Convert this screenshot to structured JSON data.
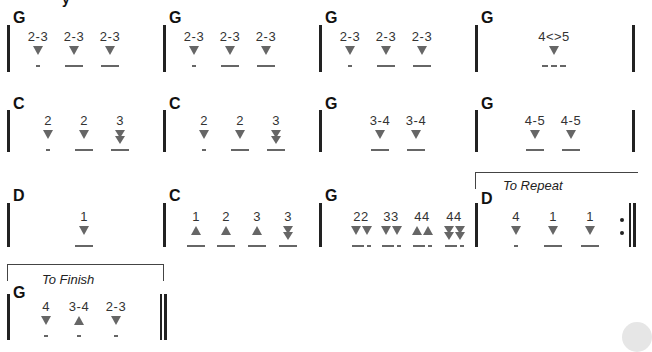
{
  "rows": [
    {
      "measures": [
        {
          "chord": "G",
          "notes": [
            {
              "num": "2-3",
              "g": "dn",
              "d": "short"
            },
            {
              "num": "2-3",
              "g": "dn",
              "d": "long"
            },
            {
              "num": "2-3",
              "g": "dn",
              "d": "long"
            }
          ]
        },
        {
          "chord": "G",
          "notes": [
            {
              "num": "2-3",
              "g": "dn",
              "d": "short"
            },
            {
              "num": "2-3",
              "g": "dn",
              "d": "long"
            },
            {
              "num": "2-3",
              "g": "dn",
              "d": "long"
            }
          ]
        },
        {
          "chord": "G",
          "notes": [
            {
              "num": "2-3",
              "g": "dn",
              "d": "short"
            },
            {
              "num": "2-3",
              "g": "dn",
              "d": "long"
            },
            {
              "num": "2-3",
              "g": "dn",
              "d": "long"
            }
          ]
        },
        {
          "chord": "G",
          "notes": [
            {
              "num": "4<>5",
              "g": "dn",
              "d": "dash"
            }
          ]
        }
      ]
    },
    {
      "measures": [
        {
          "chord": "C",
          "notes": [
            {
              "num": "2",
              "g": "dn",
              "d": "short"
            },
            {
              "num": "2",
              "g": "dn",
              "d": "long"
            },
            {
              "num": "3",
              "g": "ddn",
              "d": "long"
            }
          ]
        },
        {
          "chord": "C",
          "notes": [
            {
              "num": "2",
              "g": "dn",
              "d": "short"
            },
            {
              "num": "2",
              "g": "dn",
              "d": "long"
            },
            {
              "num": "3",
              "g": "ddn",
              "d": "long"
            }
          ]
        },
        {
          "chord": "G",
          "notes": [
            {
              "num": "3-4",
              "g": "dn",
              "d": "long"
            },
            {
              "num": "3-4",
              "g": "dn",
              "d": "long"
            }
          ]
        },
        {
          "chord": "G",
          "notes": [
            {
              "num": "4-5",
              "g": "dn",
              "d": "long"
            },
            {
              "num": "4-5",
              "g": "dn",
              "d": "long"
            }
          ]
        }
      ]
    },
    {
      "measures": [
        {
          "chord": "D",
          "notes": [
            {
              "num": "1",
              "g": "dn",
              "d": "long"
            }
          ]
        },
        {
          "chord": "C",
          "notes": [
            {
              "num": "1",
              "g": "up",
              "d": "long"
            },
            {
              "num": "2",
              "g": "up",
              "d": "long"
            },
            {
              "num": "3",
              "g": "up",
              "d": "long"
            },
            {
              "num": "3",
              "g": "ddn",
              "d": "long"
            }
          ]
        },
        {
          "chord": "G",
          "notes": [
            {
              "num": "22",
              "g": "dn2",
              "d": "lgsh"
            },
            {
              "num": "33",
              "g": "dn2",
              "d": "lgsh"
            },
            {
              "num": "44",
              "g": "up2",
              "d": "lgsh"
            },
            {
              "num": "44",
              "g": "ddn2",
              "d": "lgsh"
            }
          ]
        },
        {
          "chord": "D",
          "notes": [
            {
              "num": "4",
              "g": "dn",
              "d": "short"
            },
            {
              "num": "1",
              "g": "dn",
              "d": "long"
            },
            {
              "num": "1",
              "g": "dn",
              "d": "long"
            }
          ]
        }
      ]
    },
    {
      "measures": [
        {
          "chord": "G",
          "notes": [
            {
              "num": "4",
              "g": "dn",
              "d": "short"
            },
            {
              "num": "3-4",
              "g": "up",
              "d": "short"
            },
            {
              "num": "2-3",
              "g": "dn",
              "d": "short"
            }
          ]
        }
      ]
    }
  ],
  "voltas": {
    "repeat_label": "To Repeat",
    "finish_label": "To Finish"
  },
  "title_fragment": "y"
}
